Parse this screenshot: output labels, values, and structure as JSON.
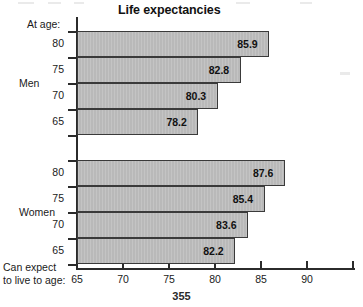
{
  "page": {
    "number": "355"
  },
  "chart_data": {
    "type": "bar",
    "orientation": "horizontal",
    "title": "Life expectancies",
    "xlabel": "Can expect to live to age:",
    "ylabel": "At age:",
    "xlim": [
      65,
      95
    ],
    "xticks": [
      65,
      70,
      75,
      80,
      85,
      90
    ],
    "xtick_labels": [
      "65",
      "70",
      "75",
      "80",
      "85",
      "90"
    ],
    "grid": false,
    "legend": "none",
    "groups": [
      {
        "name": "Men",
        "categories": [
          "80",
          "75",
          "70",
          "65"
        ],
        "values": [
          85.9,
          80.3,
          80.3,
          78.2
        ],
        "bars": [
          {
            "category": "80",
            "value": 85.9,
            "label": "85.9"
          },
          {
            "category": "75",
            "value": 82.8,
            "label": "82.8"
          },
          {
            "category": "70",
            "value": 80.3,
            "label": "80.3"
          },
          {
            "category": "65",
            "value": 78.2,
            "label": "78.2"
          }
        ]
      },
      {
        "name": "Women",
        "categories": [
          "80",
          "75",
          "70",
          "65"
        ],
        "bars": [
          {
            "category": "80",
            "value": 87.6,
            "label": "87.6"
          },
          {
            "category": "75",
            "value": 85.4,
            "label": "85.4"
          },
          {
            "category": "70",
            "value": 83.6,
            "label": "83.6"
          },
          {
            "category": "65",
            "value": 82.2,
            "label": "82.2"
          }
        ]
      }
    ],
    "series": [
      {
        "name": "Men",
        "categories": [
          "65",
          "70",
          "75",
          "80"
        ],
        "values": [
          78.2,
          80.3,
          82.8,
          85.9
        ]
      },
      {
        "name": "Women",
        "categories": [
          "65",
          "70",
          "75",
          "80"
        ],
        "values": [
          82.2,
          83.6,
          85.4,
          87.6
        ]
      }
    ],
    "bar_color": "#b9b9b9",
    "bar_edge_color": "#3a3a3a",
    "axis_color": "#2b2b2b"
  },
  "axis_caption": {
    "line1": "Can expect",
    "line2": "to live to age:"
  }
}
